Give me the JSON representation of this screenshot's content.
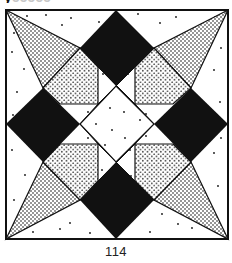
{
  "page": {
    "heading_fragment": "y",
    "heading_fragment_faint": "ccccc",
    "page_number": "114"
  },
  "figure": {
    "type": "quilt-block-illustration",
    "colors": {
      "ink": "#111111",
      "paper": "#ffffff",
      "stipple": "#111111"
    },
    "pieces": {
      "black_diamonds": [
        "top",
        "left",
        "right",
        "bottom"
      ],
      "stippled_outer_kites": [
        "top-left",
        "top-right",
        "bottom-left",
        "bottom-right"
      ],
      "stippled_inner_pieces": [
        "upper-left",
        "upper-right",
        "lower-left",
        "lower-right"
      ],
      "center": "white-diamond-with-dots"
    }
  }
}
